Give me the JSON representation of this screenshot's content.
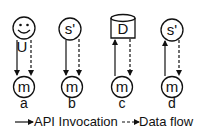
{
  "diagram": {
    "panels": [
      {
        "label": "a",
        "top_node": {
          "type": "user",
          "text": "U"
        },
        "bottom_node": {
          "text": "m"
        },
        "edges": [
          "api-down",
          "data-down"
        ]
      },
      {
        "label": "b",
        "top_node": {
          "type": "service",
          "text": "s'"
        },
        "bottom_node": {
          "text": "m"
        },
        "edges": [
          "api-down",
          "data-down"
        ]
      },
      {
        "label": "c",
        "top_node": {
          "type": "database",
          "text": "D"
        },
        "bottom_node": {
          "text": "m"
        },
        "edges": [
          "api-up",
          "data-down"
        ]
      },
      {
        "label": "d",
        "top_node": {
          "type": "service",
          "text": "s'"
        },
        "bottom_node": {
          "text": "m"
        },
        "edges": [
          "api-up",
          "data-down"
        ]
      }
    ],
    "legend": {
      "api_invocation": "API Invocation",
      "data_flow": "Data flow"
    },
    "colors": {
      "stroke": "#111111",
      "background": "#ffffff"
    }
  }
}
